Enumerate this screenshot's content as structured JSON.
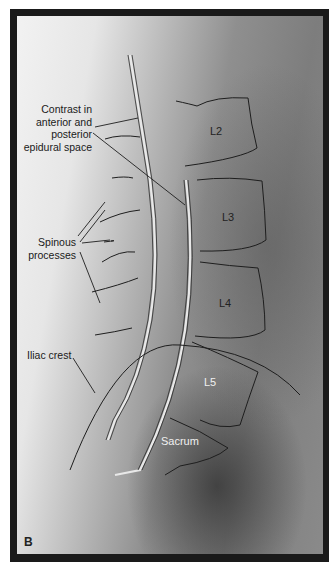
{
  "figure": {
    "panel_letter": "B",
    "vertebrae": {
      "l2": "L2",
      "l3": "L3",
      "l4": "L4",
      "l5": "L5",
      "sacrum": "Sacrum"
    },
    "annotations": {
      "contrast": [
        "Contrast in",
        "anterior and",
        "posterior",
        "epidural space"
      ],
      "spinous": [
        "Spinous",
        "processes"
      ],
      "iliac": "Iliac crest"
    },
    "colors": {
      "frame": "#1a1a1a",
      "outline": "#1e1e1e",
      "catheter": "#e8e8e8"
    }
  }
}
